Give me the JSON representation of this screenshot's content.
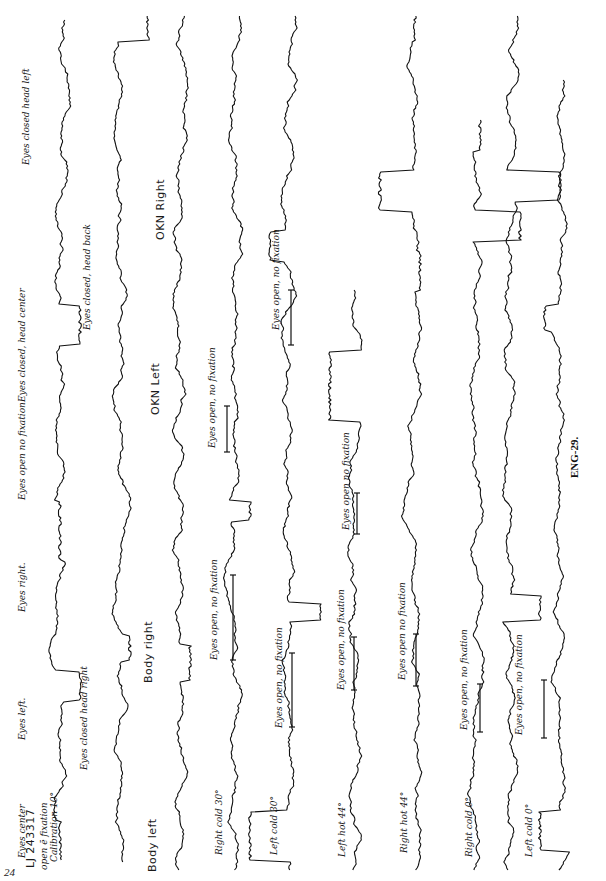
{
  "page": {
    "page_number": "24",
    "caption": "ENG-29."
  },
  "header": {
    "patient_id": "LJ 243317",
    "calibration_line1": "open ē fixation",
    "calibration_line2": "Calibration 10°"
  },
  "labels": [
    {
      "id": "eyes-center",
      "text": "Eyes center",
      "x": 23,
      "y": 858,
      "style": "it"
    },
    {
      "id": "eyes-left",
      "text": "Eyes left.",
      "x": 23,
      "y": 740,
      "style": "it"
    },
    {
      "id": "eyes-right",
      "text": "Eyes right.",
      "x": 23,
      "y": 612,
      "style": "it"
    },
    {
      "id": "eyes-open-no-fixation-1",
      "text": "Eyes open no fixation",
      "x": 23,
      "y": 500,
      "style": "it"
    },
    {
      "id": "eyes-closed-head-center",
      "text": "Eyes closed, head center",
      "x": 23,
      "y": 402,
      "style": "it"
    },
    {
      "id": "eyes-closed-head-left",
      "text": "Eyes closed head left",
      "x": 27,
      "y": 165,
      "style": "it"
    },
    {
      "id": "eyes-closed-head-right",
      "text": "Eyes closed head right",
      "x": 85,
      "y": 770,
      "style": "it"
    },
    {
      "id": "eyes-closed-head-back",
      "text": "Eyes closed, head back",
      "x": 88,
      "y": 330,
      "style": "it"
    },
    {
      "id": "body-left",
      "text": "Body left",
      "x": 152,
      "y": 872,
      "style": "up"
    },
    {
      "id": "body-right",
      "text": "Body right",
      "x": 148,
      "y": 683,
      "style": "up"
    },
    {
      "id": "okn-right",
      "text": "OKN Right",
      "x": 160,
      "y": 240,
      "style": "up"
    },
    {
      "id": "okn-left",
      "text": "OKN Left",
      "x": 155,
      "y": 415,
      "style": "up"
    },
    {
      "id": "right-cold-30",
      "text": "Right cold  30°",
      "x": 220,
      "y": 855,
      "style": "it"
    },
    {
      "id": "eyes-open-no-fixation-2",
      "text": "Eyes open, no fixation",
      "x": 215,
      "y": 660,
      "style": "it"
    },
    {
      "id": "eyes-open-no-fixation-3",
      "text": "Eyes open, no fixation",
      "x": 213,
      "y": 448,
      "style": "it"
    },
    {
      "id": "eyes-open-no-fixation-4",
      "text": "Eyes open, no fixation",
      "x": 277,
      "y": 330,
      "style": "it"
    },
    {
      "id": "left-cold-30",
      "text": "Left cold  30°",
      "x": 275,
      "y": 855,
      "style": "it"
    },
    {
      "id": "eyes-open-no-fixation-5",
      "text": "Eyes open, no fixation",
      "x": 280,
      "y": 728,
      "style": "it"
    },
    {
      "id": "eyes-open-no-fixation-6",
      "text": "Eyes open no fixation",
      "x": 347,
      "y": 530,
      "style": "it"
    },
    {
      "id": "left-hot-44",
      "text": "Left hot  44°",
      "x": 343,
      "y": 857,
      "style": "it"
    },
    {
      "id": "eyes-open-no-fixation-7",
      "text": "Eyes open, no fixation",
      "x": 342,
      "y": 690,
      "style": "it"
    },
    {
      "id": "right-hot-44",
      "text": "Right hot  44°",
      "x": 405,
      "y": 853,
      "style": "it"
    },
    {
      "id": "eyes-open-no-fixation-8",
      "text": "Eyes open no fixation",
      "x": 403,
      "y": 680,
      "style": "it"
    },
    {
      "id": "right-cold-0",
      "text": "Right cold 0°",
      "x": 470,
      "y": 857,
      "style": "it"
    },
    {
      "id": "eyes-open-no-fixation-9",
      "text": "Eyes open, no fixation",
      "x": 465,
      "y": 730,
      "style": "it"
    },
    {
      "id": "left-cold-0",
      "text": "Left cold  0°",
      "x": 530,
      "y": 857,
      "style": "it"
    },
    {
      "id": "eyes-open-no-fixation-10",
      "text": "Eyes open, no fixation",
      "x": 520,
      "y": 735,
      "style": "it"
    }
  ],
  "traces": [
    {
      "id": "trace-1",
      "cx": 60,
      "y0": 20,
      "y1": 860,
      "amp": 9,
      "seed": 3,
      "steps": [
        [
          860,
          60,
          40
        ],
        [
          700,
          80,
          30
        ],
        [
          560,
          60,
          60
        ],
        [
          345,
          80,
          40
        ]
      ]
    },
    {
      "id": "trace-2",
      "cx": 122,
      "y0": 15,
      "y1": 862,
      "amp": 8,
      "seed": 7,
      "steps": [
        [
          660,
          130,
          25
        ],
        [
          40,
          148,
          30
        ]
      ]
    },
    {
      "id": "trace-3",
      "cx": 180,
      "y0": 15,
      "y1": 870,
      "amp": 9,
      "seed": 11,
      "steps": [
        [
          680,
          190,
          35
        ],
        [
          15,
          172,
          30
        ]
      ]
    },
    {
      "id": "trace-4",
      "cx": 235,
      "y0": 15,
      "y1": 870,
      "amp": 10,
      "seed": 13,
      "steps": [
        [
          520,
          250,
          20
        ]
      ]
    },
    {
      "id": "trace-5",
      "cx": 290,
      "y0": 15,
      "y1": 870,
      "amp": 11,
      "seed": 17,
      "steps": [
        [
          860,
          250,
          50
        ],
        [
          620,
          320,
          18
        ],
        [
          260,
          270,
          30
        ]
      ]
    },
    {
      "id": "trace-6",
      "cx": 355,
      "y0": 290,
      "y1": 870,
      "amp": 11,
      "seed": 19,
      "steps": [
        [
          420,
          330,
          70
        ]
      ]
    },
    {
      "id": "trace-7",
      "cx": 415,
      "y0": 15,
      "y1": 870,
      "amp": 11,
      "seed": 23,
      "steps": [
        [
          40,
          415,
          60
        ],
        [
          210,
          380,
          40
        ],
        [
          290,
          420,
          40
        ]
      ]
    },
    {
      "id": "trace-8",
      "cx": 475,
      "y0": 120,
      "y1": 870,
      "amp": 11,
      "seed": 29,
      "steps": [
        [
          150,
          480,
          40
        ],
        [
          240,
          520,
          30
        ]
      ]
    },
    {
      "id": "trace-9",
      "cx": 510,
      "y0": 15,
      "y1": 870,
      "amp": 10,
      "seed": 31,
      "steps": [
        [
          620,
          540,
          25
        ],
        [
          200,
          560,
          30
        ]
      ]
    },
    {
      "id": "trace-10",
      "cx": 560,
      "y0": 80,
      "y1": 870,
      "amp": 10,
      "seed": 37,
      "steps": [
        [
          850,
          540,
          40
        ],
        [
          330,
          545,
          25
        ]
      ]
    }
  ],
  "bars": [
    {
      "id": "bar-2",
      "x": 233,
      "y0": 660,
      "y1": 575
    },
    {
      "id": "bar-3",
      "x": 227,
      "y0": 452,
      "y1": 406
    },
    {
      "id": "bar-4",
      "x": 291,
      "y0": 345,
      "y1": 290
    },
    {
      "id": "bar-5",
      "x": 292,
      "y0": 727,
      "y1": 653
    },
    {
      "id": "bar-6",
      "x": 357,
      "y0": 534,
      "y1": 493
    },
    {
      "id": "bar-7",
      "x": 354,
      "y0": 690,
      "y1": 637
    },
    {
      "id": "bar-8",
      "x": 416,
      "y0": 686,
      "y1": 634
    },
    {
      "id": "bar-9",
      "x": 480,
      "y0": 732,
      "y1": 684
    },
    {
      "id": "bar-10",
      "x": 544,
      "y0": 738,
      "y1": 680
    }
  ]
}
